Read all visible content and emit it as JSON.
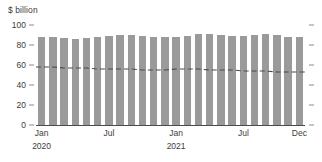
{
  "axis_title": "$ billion",
  "colors": {
    "bar": "#9a9a9a",
    "trend_line": "#4a4a4a",
    "axis": "#4a4a4a",
    "text": "#3c3c3c",
    "background": "#ffffff"
  },
  "yaxis": {
    "ticks": [
      0,
      20,
      40,
      60,
      80,
      100
    ],
    "labels": [
      "0",
      "20",
      "40",
      "60",
      "80",
      "100"
    ],
    "min": 0,
    "max": 100
  },
  "xaxis": {
    "labels": [
      {
        "text": "Jan",
        "year": "2020",
        "index": 0
      },
      {
        "text": "Jul",
        "year": "",
        "index": 6
      },
      {
        "text": "Jan",
        "year": "2021",
        "index": 12
      },
      {
        "text": "Jul",
        "year": "",
        "index": 18
      },
      {
        "text": "Dec",
        "year": "",
        "index": 23
      }
    ]
  },
  "chart_data": {
    "type": "bar",
    "title": "",
    "subtitle": "",
    "xlabel": "",
    "ylabel": "$ billion",
    "ylim": [
      0,
      100
    ],
    "grid": false,
    "legend": "none",
    "categories": [
      "Jan 2020",
      "Feb 2020",
      "Mar 2020",
      "Apr 2020",
      "May 2020",
      "Jun 2020",
      "Jul 2020",
      "Aug 2020",
      "Sep 2020",
      "Oct 2020",
      "Nov 2020",
      "Dec 2020",
      "Jan 2021",
      "Feb 2021",
      "Mar 2021",
      "Apr 2021",
      "May 2021",
      "Jun 2021",
      "Jul 2021",
      "Aug 2021",
      "Sep 2021",
      "Oct 2021",
      "Nov 2021",
      "Dec 2021"
    ],
    "series": [
      {
        "name": "Total",
        "type": "bar",
        "values": [
          88,
          88,
          87,
          86,
          87,
          88,
          89,
          90,
          90,
          89,
          88,
          88,
          88,
          89,
          91,
          91,
          90,
          89,
          89,
          90,
          91,
          90,
          88,
          88
        ]
      },
      {
        "name": "Trend",
        "type": "line",
        "style": "dashed",
        "values": [
          58,
          58,
          57,
          57,
          57,
          56,
          56,
          56,
          56,
          55,
          55,
          55,
          56,
          56,
          56,
          55,
          55,
          55,
          54,
          54,
          54,
          53,
          53,
          53
        ]
      }
    ]
  }
}
